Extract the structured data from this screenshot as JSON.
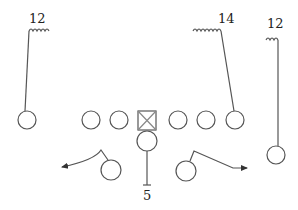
{
  "diagram": {
    "type": "football-play",
    "labels": {
      "left_receiver_number": "12",
      "slot_receiver_number": "14",
      "right_receiver_number": "12",
      "quarterback_number": "5"
    },
    "colors": {
      "stroke": "#555555",
      "text": "#222222",
      "background": "#ffffff"
    }
  }
}
